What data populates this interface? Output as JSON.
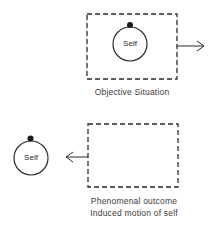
{
  "figure": {
    "panels": [
      {
        "id": "objective",
        "circle_label": "Self",
        "caption_lines": [
          "Objective Situation"
        ],
        "arrow_direction": "right"
      },
      {
        "id": "phenomenal",
        "circle_label": "Self",
        "caption_lines": [
          "Phenomenal outcome",
          "Induced motion of self"
        ],
        "arrow_direction": "left"
      }
    ],
    "colors": {
      "stroke": "#2a2a2a",
      "background": "#ffffff"
    }
  }
}
